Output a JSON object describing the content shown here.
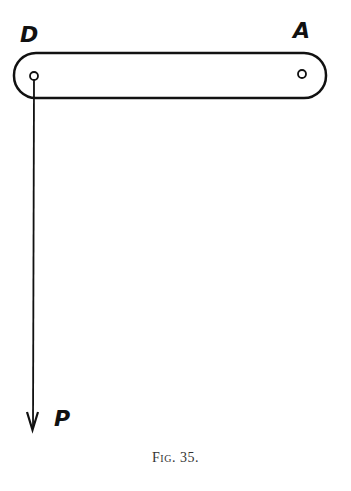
{
  "figure": {
    "caption": "Fig. 35.",
    "labels": {
      "left_pin": "D",
      "right_pin": "A",
      "force": "P"
    },
    "colors": {
      "ink": "#111111",
      "background": "#ffffff"
    },
    "elements": {
      "bar": {
        "x": 14,
        "y": 53,
        "width": 312,
        "height": 45,
        "corner_radius": 22
      },
      "hole_d": {
        "cx": 34,
        "cy": 76,
        "r": 4
      },
      "hole_a": {
        "cx": 302,
        "cy": 74,
        "r": 4
      },
      "force_arrow": {
        "x": 34,
        "y_start": 80,
        "y_end": 430,
        "direction": "down"
      }
    }
  }
}
